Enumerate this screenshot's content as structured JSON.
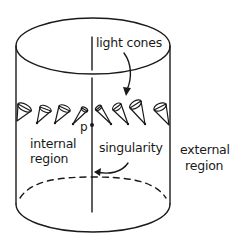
{
  "diagram": {
    "labels": {
      "light_cones": "light cones",
      "point_p": "p",
      "internal_line1": "internal",
      "internal_line2": "region",
      "singularity": "singularity",
      "external_line1": "external",
      "external_line2": "region"
    },
    "colors": {
      "ink": "#1a1a1a",
      "background": "#ffffff"
    },
    "light_cone_count": 8
  }
}
